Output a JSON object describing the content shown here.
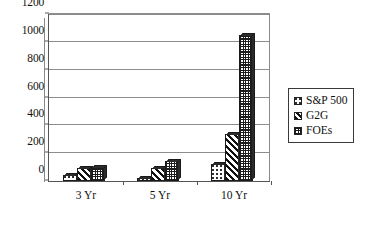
{
  "chart_data": {
    "type": "bar",
    "title": "",
    "subtitle": "",
    "xlabel": "",
    "ylabel": "",
    "categories": [
      "3 Yr",
      "5 Yr",
      "10 Yr"
    ],
    "series": [
      {
        "name": "S&P 500",
        "values": [
          45,
          25,
          120
        ],
        "pattern": "dotted-light"
      },
      {
        "name": "G2G",
        "values": [
          95,
          95,
          336
        ],
        "pattern": "diagonal-stripes"
      },
      {
        "name": "FOEs",
        "values": [
          100,
          145,
          1040
        ],
        "pattern": "checkerboard"
      }
    ],
    "ylim": [
      0,
      1200
    ],
    "yticks": [
      0,
      200,
      400,
      600,
      800,
      1000,
      1200
    ],
    "ytick_labels": [
      "0",
      "200",
      "400",
      "600",
      "800",
      "1000",
      "1200"
    ],
    "grid": true,
    "grid_axis": "y",
    "legend_position": "right",
    "style": "3d-grouped-columns"
  },
  "legend": {
    "entries": [
      {
        "label": "S&P 500"
      },
      {
        "label": "G2G"
      },
      {
        "label": "FOEs"
      }
    ]
  },
  "colors": {
    "axis": "#555555",
    "gridline": "#8d8d8d",
    "bar_outline": "#1a1a1a",
    "bar_shade": "#2b2b2b",
    "text": "#111111",
    "background": "#ffffff"
  }
}
